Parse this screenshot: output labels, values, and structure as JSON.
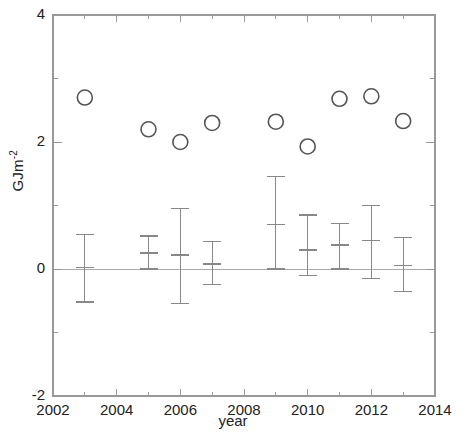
{
  "chart_data": {
    "type": "scatter",
    "title": "",
    "xlabel": "year",
    "ylabel": "GJm-2",
    "ylabel_base": "GJm",
    "ylabel_exponent": "-2",
    "xlim": [
      2002,
      2014
    ],
    "ylim": [
      -2,
      4
    ],
    "x_major_ticks": [
      2002,
      2004,
      2006,
      2008,
      2010,
      2012,
      2014
    ],
    "x_minor_ticks": [
      2003,
      2005,
      2007,
      2009,
      2011,
      2013
    ],
    "x_tick_labels": [
      "2002",
      "2004",
      "2006",
      "2008",
      "2010",
      "2012",
      "2014"
    ],
    "y_major_ticks": [
      -2,
      0,
      2,
      4
    ],
    "y_minor_ticks": [
      -1,
      1,
      3
    ],
    "y_tick_labels": [
      "-2",
      "0",
      "2",
      "4"
    ],
    "grid": false,
    "legend": null,
    "zero_line": true,
    "marker_style": "open-circle",
    "marker_color": "#555555",
    "errorbar_color": "#888888",
    "axis_color": "#999999",
    "series": [
      {
        "name": "annual value",
        "marker": "open-circle",
        "x": [
          2003,
          2005,
          2006,
          2007,
          2009,
          2010,
          2011,
          2012,
          2013
        ],
        "values": [
          2.7,
          2.2,
          2.0,
          2.3,
          2.32,
          1.93,
          2.68,
          2.72,
          2.33
        ]
      },
      {
        "name": "change with error bars",
        "marker": "errorbar",
        "x": [
          2003,
          2005,
          2006,
          2007,
          2009,
          2010,
          2011,
          2012,
          2013
        ],
        "values": [
          0.02,
          0.25,
          0.22,
          0.08,
          0.7,
          0.3,
          0.38,
          0.45,
          0.05
        ],
        "upper": [
          0.55,
          0.52,
          0.95,
          0.43,
          1.45,
          0.85,
          0.72,
          1.0,
          0.5
        ],
        "lower": [
          -0.52,
          0.0,
          -0.55,
          -0.25,
          0.0,
          -0.1,
          0.0,
          -0.15,
          -0.35
        ]
      }
    ]
  },
  "axes": {
    "ylabel_display": "GJm",
    "ylabel_sup": "-2",
    "xlabel_display": "year"
  }
}
